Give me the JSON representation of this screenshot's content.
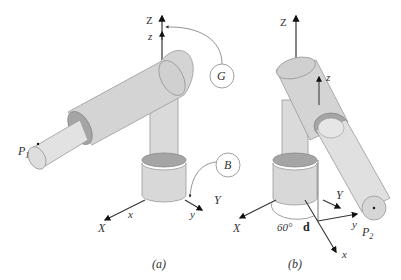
{
  "panels": [
    {
      "id": "a",
      "caption": "(a)",
      "global_axes": {
        "Z": "Z",
        "X": "X",
        "Y": "Y"
      },
      "body_axes": {
        "z": "z",
        "x": "x",
        "y": "y"
      },
      "frame_labels": {
        "G": "G",
        "B": "B"
      },
      "point_label": {
        "main": "P",
        "sub": "1"
      }
    },
    {
      "id": "b",
      "caption": "(b)",
      "global_axes": {
        "Z": "Z",
        "X": "X",
        "Y": "Y"
      },
      "body_axes": {
        "z": "z",
        "x": "x",
        "y": "y"
      },
      "angle_label": "60°",
      "displacement_label": "d",
      "point_label": {
        "main": "P",
        "sub": "2"
      }
    }
  ],
  "colors": {
    "cylinder_fill": "#dcdcdc",
    "cylinder_dark": "#a8a8a8",
    "cylinder_ring": "#9a9a9a",
    "axis": "#333333",
    "background": "#ffffff"
  }
}
